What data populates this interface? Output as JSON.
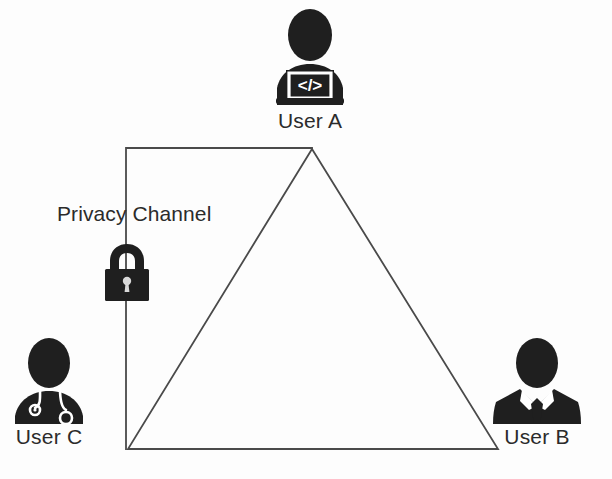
{
  "diagram": {
    "title": "Privacy Channel",
    "background_color": "#fdfdfd",
    "line_color": "#4a4a4a",
    "icon_color": "#1f1f1f",
    "text_color": "#2b2b2b"
  },
  "actors": [
    {
      "id": "user-a",
      "label": "User A",
      "icon": "developer-with-laptop-icon",
      "screen_glyph": "</>",
      "position": "top"
    },
    {
      "id": "user-b",
      "label": "User B",
      "icon": "businessman-suit-tie-icon",
      "position": "bottom-right"
    },
    {
      "id": "user-c",
      "label": "User C",
      "icon": "doctor-stethoscope-icon",
      "position": "bottom-left"
    }
  ],
  "channel": {
    "label": "Privacy Channel",
    "icon": "padlock-icon",
    "state": "locked"
  },
  "shapes": {
    "triangle": {
      "apex": [
        312,
        149
      ],
      "bottom_left": [
        128,
        449
      ],
      "bottom_right": [
        498,
        449
      ]
    },
    "channel_path": {
      "corner": [
        126,
        149
      ],
      "apex_end": [
        312,
        149
      ],
      "bottom_end": [
        126,
        449
      ]
    }
  }
}
